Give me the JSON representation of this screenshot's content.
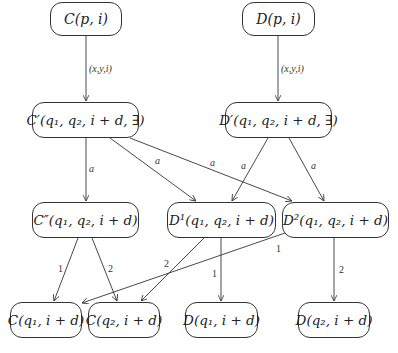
{
  "nodes": {
    "c_p_i": "C(p, i)",
    "d_p_i": "D(p, i)",
    "c_prime": "C′(q₁, q₂, i + d, ∃)",
    "d_prime": "D′(q₁, q₂, i + d, ∃)",
    "c_dprime": "C″(q₁, q₂, i + d)",
    "d1": "D¹(q₁, q₂, i + d)",
    "d2": "D²(q₁, q₂, i + d)",
    "c_q1": "C(q₁, i + d)",
    "c_q2": "C(q₂, i + d)",
    "d_q1": "D(q₁, i + d)",
    "d_q2": "D(q₂, i + d)"
  },
  "edge_labels": {
    "c_to_cprime": "(x,y,i)",
    "d_to_dprime": "(x,y,i)",
    "cprime_to_cdprime": "a",
    "cprime_to_d1": "a",
    "cprime_to_d2": "a",
    "dprime_to_d1": "a",
    "dprime_to_d2": "a",
    "cdprime_to_cq1": "1",
    "cdprime_to_cq2": "2",
    "d1_to_cq2": "2",
    "d1_to_dq1": "1",
    "d2_to_cq1": "1",
    "d2_to_dq2": "2"
  },
  "colors": {
    "stroke": "#333333",
    "text": "#222222"
  }
}
